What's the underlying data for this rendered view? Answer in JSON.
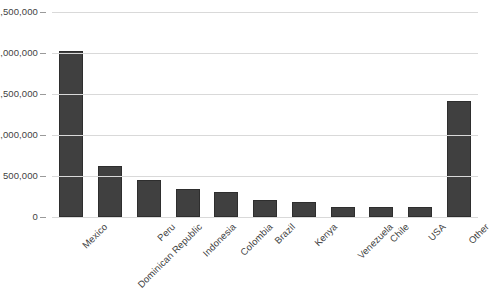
{
  "chart_data": {
    "type": "bar",
    "title": "",
    "xlabel": "",
    "ylabel": "",
    "categories": [
      "Mexico",
      "Dominican Republic",
      "Peru",
      "Indonesia",
      "Colombia",
      "Brazil",
      "Kenya",
      "Venezuela",
      "Chile",
      "USA",
      "Other"
    ],
    "values": [
      2020000,
      620000,
      450000,
      340000,
      300000,
      205000,
      180000,
      125000,
      120000,
      118000,
      1410000
    ],
    "ylim": [
      0,
      2500000
    ],
    "y_ticks": [
      0,
      500000,
      1000000,
      1500000,
      2000000,
      2500000
    ],
    "y_tick_labels": [
      "0",
      "500,000",
      "1,000,000",
      "1,500,000",
      "2,000,000",
      "2,500,000"
    ],
    "grid": true,
    "legend": false,
    "legend_position": "none",
    "bar_color": "#404040",
    "gridline_color": "#d9d9d9",
    "axis_color": "#7f7f7f",
    "text_color": "#3f3f3f",
    "x_label_rotation": -45
  }
}
